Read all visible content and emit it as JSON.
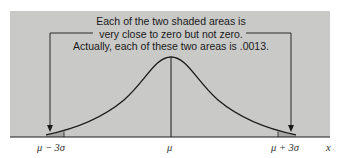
{
  "annotation": {
    "lines": [
      "Each of the two shaded areas is",
      "very close to zero but not zero.",
      "Actually, each of these two areas is .0013."
    ]
  },
  "axis": {
    "tick_labels": [
      "μ − 3σ",
      "μ",
      "μ + 3σ"
    ],
    "axis_label": "x"
  },
  "colors": {
    "panel": "#c9c9c7",
    "curve": "#1a1a1a",
    "shaded_tail": "#a8a8a6"
  }
}
